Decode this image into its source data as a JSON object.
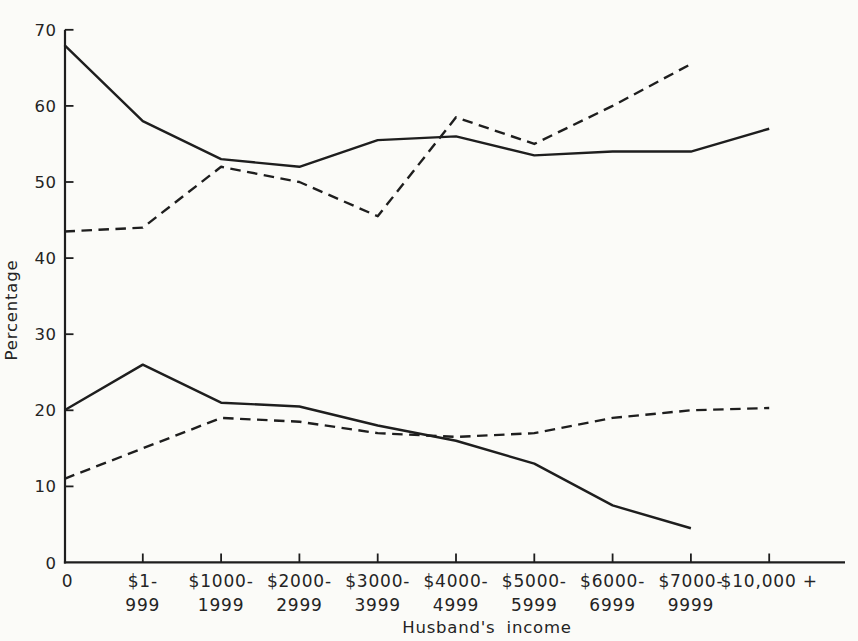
{
  "figure": {
    "background_color": "#fbfbf8",
    "ink_color": "#1e1e1e",
    "has_title": false,
    "has_legend": false
  },
  "chart_data": {
    "type": "line",
    "title": "",
    "xlabel": "Husband's income",
    "ylabel": "Percentage",
    "ylim": [
      0,
      70
    ],
    "grid": false,
    "legend_position": "none",
    "yticks": [
      0,
      10,
      20,
      30,
      40,
      50,
      60,
      70
    ],
    "categories": [
      "0",
      "$1-999",
      "$1000-1999",
      "$2000-2999",
      "$3000-3999",
      "$4000-4999",
      "$5000-5999",
      "$6000-6999",
      "$7000-9999",
      "$10,000 +"
    ],
    "category_display_lines": [
      [
        "0"
      ],
      [
        "$1-",
        "999"
      ],
      [
        "$1000-",
        "1999"
      ],
      [
        "$2000-",
        "2999"
      ],
      [
        "$3000-",
        "3999"
      ],
      [
        "$4000-",
        "4999"
      ],
      [
        "$5000-",
        "5999"
      ],
      [
        "$6000-",
        "6999"
      ],
      [
        "$7000-",
        "9999"
      ],
      [
        "$10,000 +"
      ]
    ],
    "series": [
      {
        "name": "upper-solid-line",
        "line_style": "solid",
        "values": [
          68,
          58,
          53,
          52,
          55.5,
          56,
          53.5,
          54,
          54,
          57
        ]
      },
      {
        "name": "upper-dashed-line",
        "line_style": "dashed",
        "values": [
          43.5,
          44,
          52,
          50,
          45.5,
          58.5,
          55,
          60,
          65.5,
          null
        ]
      },
      {
        "name": "lower-solid-line",
        "line_style": "solid",
        "values": [
          20,
          26,
          21,
          20.5,
          18,
          16,
          13,
          7.5,
          4.5,
          null
        ]
      },
      {
        "name": "lower-dashed-line",
        "line_style": "dashed",
        "values": [
          11,
          15,
          19,
          18.5,
          17,
          16.5,
          17,
          19,
          20,
          20.3
        ]
      }
    ]
  }
}
